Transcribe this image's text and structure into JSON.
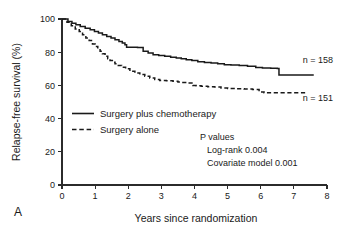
{
  "panel": {
    "label": "A"
  },
  "chart_data": {
    "type": "line",
    "subtype": "kaplan-meier-step",
    "title": "",
    "xlabel": "Years since randomization",
    "ylabel": "Relapse-free survival (%)",
    "xlim": [
      0,
      8
    ],
    "ylim": [
      0,
      100
    ],
    "xticks": [
      0,
      1,
      2,
      3,
      4,
      5,
      6,
      7,
      8
    ],
    "xtick_labels": [
      "0",
      "1",
      "2",
      "3",
      "4",
      "5",
      "6",
      "7",
      "8"
    ],
    "yticks": [
      0,
      20,
      40,
      60,
      80,
      100
    ],
    "ytick_labels": [
      "0",
      "20",
      "40",
      "60",
      "80",
      "100"
    ],
    "grid": false,
    "legend_position": "lower-left-inside",
    "series": [
      {
        "name": "Surgery plus chemotherapy",
        "style": "solid",
        "color": "#1a1a1a",
        "n_label": "n = 158",
        "n": 158,
        "x": [
          0.0,
          0.18,
          0.3,
          0.42,
          0.55,
          0.7,
          0.85,
          0.98,
          1.1,
          1.22,
          1.35,
          1.48,
          1.6,
          1.72,
          1.82,
          1.9,
          1.95,
          2.1,
          2.28,
          2.45,
          2.6,
          2.75,
          2.92,
          3.1,
          3.28,
          3.45,
          3.6,
          3.75,
          3.92,
          4.1,
          4.3,
          4.5,
          4.7,
          4.9,
          5.1,
          5.35,
          5.6,
          5.85,
          6.05,
          6.3,
          6.5,
          6.55,
          7.6
        ],
        "y": [
          100.0,
          98.5,
          97.5,
          96.5,
          95.5,
          94.5,
          93.5,
          92.5,
          91.5,
          90.5,
          89.5,
          88.5,
          87.5,
          86.5,
          85.5,
          84.5,
          83.0,
          83.0,
          82.8,
          80.5,
          79.5,
          78.5,
          78.0,
          77.5,
          77.0,
          76.5,
          76.0,
          75.5,
          75.0,
          74.2,
          73.8,
          73.5,
          73.0,
          72.5,
          72.3,
          72.0,
          71.5,
          70.8,
          70.5,
          70.3,
          70.2,
          66.3,
          66.3
        ]
      },
      {
        "name": "Surgery alone",
        "style": "dashed",
        "color": "#1a1a1a",
        "n_label": "n = 151",
        "n": 151,
        "x": [
          0.0,
          0.15,
          0.28,
          0.4,
          0.52,
          0.62,
          0.72,
          0.82,
          0.92,
          1.0,
          1.08,
          1.15,
          1.22,
          1.3,
          1.38,
          1.45,
          1.52,
          1.6,
          1.7,
          1.8,
          1.92,
          2.05,
          2.2,
          2.35,
          2.5,
          2.65,
          2.8,
          2.95,
          3.15,
          3.35,
          3.5,
          3.62,
          3.78,
          3.95,
          4.05,
          4.2,
          4.4,
          4.6,
          4.8,
          5.0,
          5.25,
          5.5,
          5.75,
          5.95,
          6.1,
          7.4
        ],
        "y": [
          100.0,
          98.0,
          96.0,
          94.0,
          92.5,
          90.5,
          88.5,
          87.0,
          85.0,
          83.5,
          82.0,
          80.5,
          79.0,
          77.5,
          76.0,
          75.0,
          74.0,
          73.0,
          72.0,
          71.0,
          70.0,
          68.5,
          67.5,
          66.5,
          65.5,
          64.5,
          63.5,
          63.0,
          62.8,
          62.5,
          62.0,
          61.8,
          61.5,
          60.0,
          59.8,
          59.5,
          59.2,
          59.0,
          58.5,
          58.2,
          58.0,
          57.8,
          57.5,
          56.0,
          55.5,
          55.5
        ]
      }
    ],
    "annotations": {
      "p_values_heading": "P values",
      "p_value_lines": [
        "Log-rank 0.004",
        "Covariate model 0.001"
      ]
    }
  }
}
